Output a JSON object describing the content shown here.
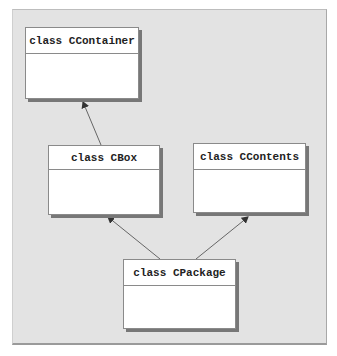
{
  "diagram": {
    "type": "UML class inheritance",
    "classes": [
      {
        "id": "ccontainer",
        "label": "class CContainer"
      },
      {
        "id": "cbox",
        "label": "class CBox"
      },
      {
        "id": "ccontents",
        "label": "class CContents"
      },
      {
        "id": "cpackage",
        "label": "class CPackage"
      }
    ],
    "edges": [
      {
        "from": "cbox",
        "to": "ccontainer",
        "kind": "inherits"
      },
      {
        "from": "cpackage",
        "to": "cbox",
        "kind": "inherits"
      },
      {
        "from": "cpackage",
        "to": "ccontents",
        "kind": "inherits"
      }
    ]
  },
  "colors": {
    "panel_bg": "#e3e3e3",
    "box_bg": "#ffffff",
    "box_border": "#8a8a8a",
    "shadow": "#777777",
    "arrow": "#666666"
  }
}
